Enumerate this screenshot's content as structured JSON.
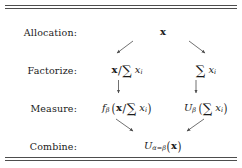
{
  "figure": {
    "name": "allocation-decomposition-table",
    "rules": {
      "top": "double",
      "bottom": "double",
      "color": "#4d4d4d"
    }
  },
  "rows": [
    {
      "key": "allocation",
      "label": "Allocation:",
      "cells": [
        {
          "position": "center",
          "latex": "\\mathbf{x}",
          "plain": "x"
        }
      ]
    },
    {
      "key": "factorize",
      "label": "Factorize:",
      "cells": [
        {
          "position": "left",
          "latex": "\\mathbf{x}/\\sum_i x_i",
          "plain": "x/∑i xi"
        },
        {
          "position": "right",
          "latex": "\\sum_i x_i",
          "plain": "∑i xi"
        }
      ]
    },
    {
      "key": "measure",
      "label": "Measure:",
      "cells": [
        {
          "position": "left",
          "latex": "f_\\beta\\left(\\mathbf{x}/\\sum_i x_i\\right)",
          "plain": "fβ (x/∑i xi)"
        },
        {
          "position": "right",
          "latex": "U_\\beta\\left(\\sum_i x_i\\right)",
          "plain": "Uβ (∑i xi)"
        }
      ]
    },
    {
      "key": "combine",
      "label": "Combine:",
      "cells": [
        {
          "position": "center",
          "latex": "U_{\\alpha=\\beta}(\\mathbf{x})",
          "plain": "Uα=β(x)"
        }
      ]
    }
  ],
  "symbols": {
    "vector_x": "x",
    "sum_symbol": "∑",
    "sum_index": "i",
    "element_x": "x",
    "element_index": "i",
    "slash": "/",
    "paren_open": "(",
    "paren_close": ")",
    "f_name": "f",
    "U_name": "U",
    "beta": "β",
    "alpha": "α",
    "equals": "=",
    "subscript_alpha_eq_beta": "α=β"
  },
  "arrows": [
    {
      "name": "branch-left",
      "from": "allocation",
      "to": "factorize",
      "direction": "down-left"
    },
    {
      "name": "branch-right",
      "from": "allocation",
      "to": "factorize",
      "direction": "down-right"
    },
    {
      "name": "measure-left",
      "from": "factorize",
      "to": "measure",
      "direction": "down"
    },
    {
      "name": "measure-right",
      "from": "factorize",
      "to": "measure",
      "direction": "down"
    },
    {
      "name": "combine-left",
      "from": "measure",
      "to": "combine",
      "direction": "down-right"
    },
    {
      "name": "combine-right",
      "from": "measure",
      "to": "combine",
      "direction": "down-left"
    }
  ]
}
